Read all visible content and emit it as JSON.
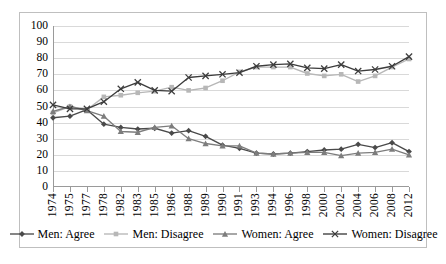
{
  "chart_data": {
    "type": "line",
    "title": "",
    "xlabel": "",
    "ylabel": "",
    "ylim": [
      0,
      100
    ],
    "ytick_step": 10,
    "yticks": [
      100,
      90,
      80,
      70,
      60,
      50,
      40,
      30,
      20,
      10,
      0
    ],
    "grid": true,
    "legend_position": "bottom",
    "categories": [
      "1974",
      "1975",
      "1977",
      "1978",
      "1982",
      "1983",
      "1985",
      "1986",
      "1988",
      "1989",
      "1990",
      "1991",
      "1993",
      "1994",
      "1996",
      "1998",
      "2000",
      "2002",
      "2004",
      "2006",
      "2008",
      "2012"
    ],
    "series": [
      {
        "name": "Men: Agree",
        "marker": "diamond",
        "color": "#4a4a4a",
        "values": [
          43,
          44,
          48,
          39,
          37,
          36,
          36.5,
          33.5,
          35,
          31.5,
          26,
          24,
          21,
          20.5,
          21,
          22,
          23,
          23.5,
          26.5,
          24.5,
          27.5,
          22
        ]
      },
      {
        "name": "Men: Disagree",
        "marker": "square",
        "color": "#b7b7b7",
        "values": [
          46,
          50,
          48,
          56,
          57,
          58.5,
          59.5,
          62,
          60,
          61.5,
          66,
          71.5,
          74.5,
          74.5,
          74.5,
          70.5,
          69,
          70,
          65.5,
          69,
          74.5,
          79.5
        ]
      },
      {
        "name": "Women: Agree",
        "marker": "triangle",
        "color": "#7d7d7d",
        "values": [
          47,
          50,
          47.5,
          44,
          34.5,
          34,
          37,
          38,
          30,
          27,
          25.5,
          25.5,
          21,
          20.5,
          21,
          21.5,
          21.5,
          19.5,
          21,
          21.5,
          23.5,
          20
        ]
      },
      {
        "name": "Women: Disagree",
        "marker": "x",
        "color": "#3c3c3c",
        "values": [
          51,
          48.5,
          48.5,
          53,
          61,
          65,
          60,
          59.5,
          68,
          69,
          70,
          71,
          75,
          76,
          76.5,
          74,
          73.5,
          76,
          72,
          73,
          75,
          81
        ]
      }
    ]
  },
  "axis": {
    "y_labels": [
      "100",
      "90",
      "80",
      "70",
      "60",
      "50",
      "40",
      "30",
      "20",
      "10",
      "0"
    ]
  },
  "legend": {
    "items": [
      {
        "label": "Men: Agree"
      },
      {
        "label": "Men: Disagree"
      },
      {
        "label": "Women: Agree"
      },
      {
        "label": "Women: Disagree"
      }
    ]
  }
}
